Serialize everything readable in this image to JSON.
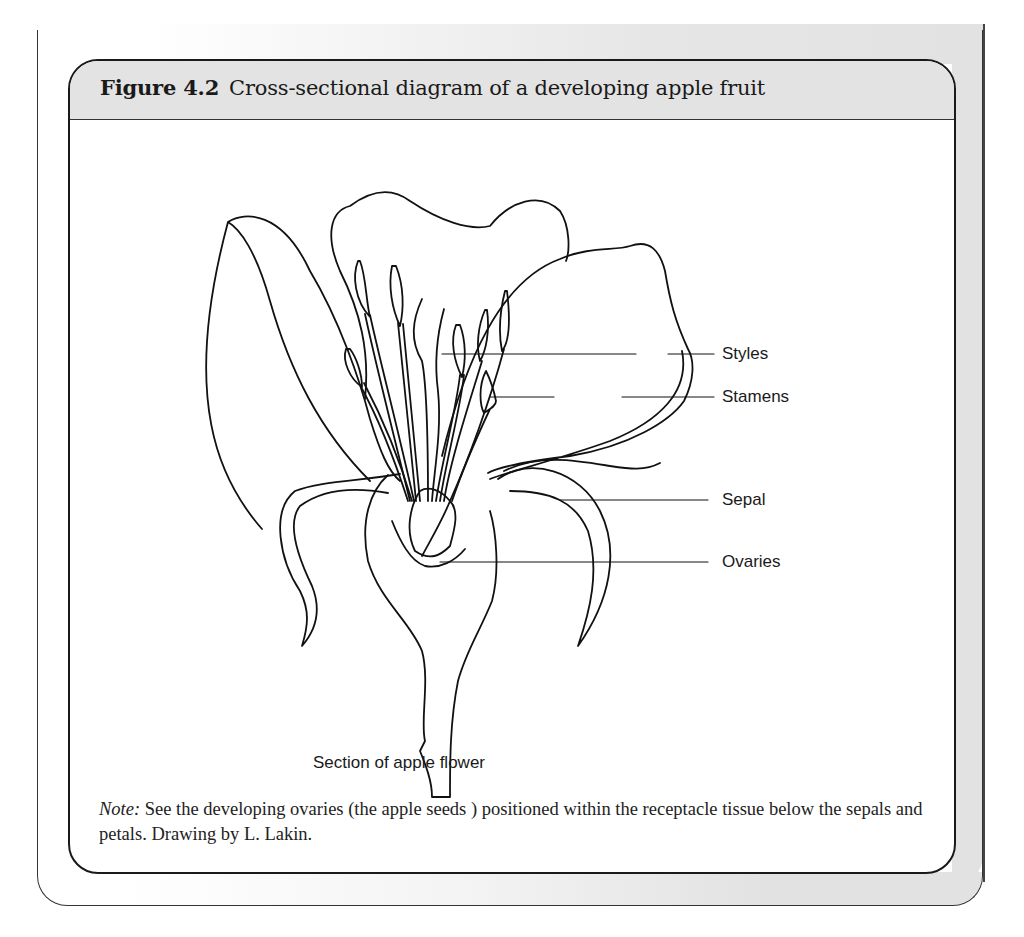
{
  "figure": {
    "number_label": "Figure 4.2",
    "title": "Cross-sectional diagram of a developing apple fruit"
  },
  "diagram": {
    "labels": {
      "styles": "Styles",
      "stamens": "Stamens",
      "sepal": "Sepal",
      "ovaries": "Ovaries"
    },
    "caption": "Section of apple flower"
  },
  "note": {
    "label": "Note:",
    "text": " See the developing ovaries (the apple seeds ) positioned within the receptacle tissue below the sepals and petals. Drawing by L. Lakin."
  }
}
